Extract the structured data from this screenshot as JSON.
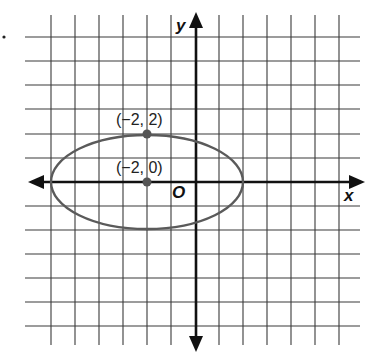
{
  "figure": {
    "axes": {
      "x_label": "x",
      "y_label": "y",
      "origin_label": "O",
      "x_range": [
        -6,
        7
      ],
      "y_range": [
        -6,
        6
      ],
      "grid_unit": 1
    },
    "ellipse": {
      "center": [
        -2,
        0
      ],
      "semi_major_horizontal": 4,
      "semi_minor_vertical": 2,
      "color": "#5a5a5a"
    },
    "points": [
      {
        "label": "(−2, 2)",
        "x": -2,
        "y": 2
      },
      {
        "label": "(−2, 0)",
        "x": -2,
        "y": 0
      }
    ],
    "stray_mark": "•"
  }
}
